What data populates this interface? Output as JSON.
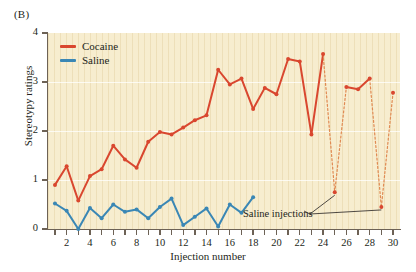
{
  "panel": {
    "label": "(B)"
  },
  "legend": {
    "items": [
      {
        "name": "Cocaine",
        "color": "#d9472f"
      },
      {
        "name": "Saline",
        "color": "#3a87b5"
      }
    ]
  },
  "annotation": {
    "text": "Saline injections"
  },
  "colors": {
    "plot_background": "#f7edcf",
    "axis": "#6d6256",
    "cocaine": "#d9472f",
    "saline": "#3a87b5",
    "dashed_link": "#e08a52",
    "text": "#231f20"
  },
  "chart_data": {
    "type": "line",
    "title": "",
    "xlabel": "Injection number",
    "ylabel": "Stereotypy ratings",
    "xlim": [
      0.4,
      30.6
    ],
    "ylim": [
      0,
      4
    ],
    "ytick_values": [
      0,
      1,
      2,
      3,
      4
    ],
    "ytick_labels": [
      "0",
      "1",
      "2",
      "3",
      "4"
    ],
    "xtick_values": [
      1,
      2,
      3,
      4,
      5,
      6,
      7,
      8,
      9,
      10,
      11,
      12,
      13,
      14,
      15,
      16,
      17,
      18,
      19,
      20,
      21,
      22,
      23,
      24,
      25,
      26,
      27,
      28,
      29,
      30
    ],
    "xtick_labels_shown": [
      2,
      4,
      6,
      8,
      10,
      12,
      14,
      16,
      18,
      20,
      22,
      24,
      26,
      28,
      30
    ],
    "grid": "horizontal-faint",
    "legend_position": "top-left",
    "series": [
      {
        "name": "Cocaine",
        "color": "#d9472f",
        "marker": "circle",
        "x": [
          1,
          2,
          3,
          4,
          5,
          6,
          7,
          8,
          9,
          10,
          11,
          12,
          13,
          14,
          15,
          16,
          17,
          18,
          19,
          20,
          21,
          22,
          23,
          24,
          25,
          26,
          27,
          28,
          29,
          30
        ],
        "values": [
          0.9,
          1.28,
          0.58,
          1.08,
          1.22,
          1.7,
          1.42,
          1.25,
          1.78,
          1.98,
          1.93,
          2.07,
          2.22,
          2.32,
          3.25,
          2.95,
          3.07,
          2.45,
          2.88,
          2.75,
          3.47,
          3.42,
          1.93,
          3.57,
          0.75,
          2.9,
          2.85,
          3.07,
          0.45,
          2.78
        ],
        "saline_injection_points": [
          25,
          29
        ],
        "dashed_segments": [
          [
            24,
            25
          ],
          [
            25,
            26
          ],
          [
            28,
            29
          ],
          [
            29,
            30
          ]
        ]
      },
      {
        "name": "Saline",
        "color": "#3a87b5",
        "marker": "circle",
        "x": [
          1,
          2,
          3,
          4,
          5,
          6,
          7,
          8,
          9,
          10,
          11,
          12,
          13,
          14,
          15,
          16,
          17,
          18
        ],
        "values": [
          0.52,
          0.37,
          0.0,
          0.43,
          0.22,
          0.5,
          0.35,
          0.4,
          0.22,
          0.45,
          0.62,
          0.08,
          0.25,
          0.42,
          0.05,
          0.5,
          0.33,
          0.65
        ]
      }
    ]
  }
}
